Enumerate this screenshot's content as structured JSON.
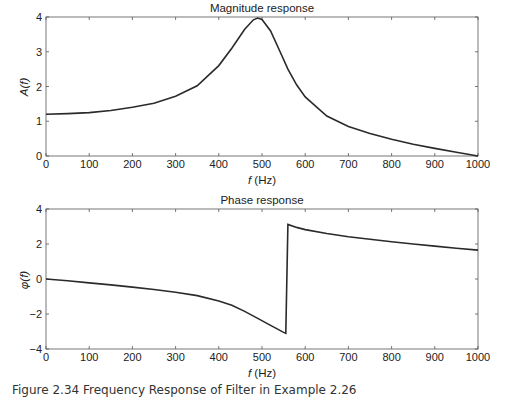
{
  "figure": {
    "caption": "Figure 2.34 Frequency Response of Filter in Example 2.26"
  },
  "chart_data": [
    {
      "type": "line",
      "title": "Magnitude response",
      "xlabel": "f (Hz)",
      "ylabel": "A(f)",
      "xlim": [
        0,
        1000
      ],
      "ylim": [
        0,
        4
      ],
      "xticks": [
        0,
        100,
        200,
        300,
        400,
        500,
        600,
        700,
        800,
        900,
        1000
      ],
      "yticks": [
        0,
        1,
        2,
        3,
        4
      ],
      "grid": false,
      "series": [
        {
          "name": "A(f)",
          "x": [
            0,
            50,
            100,
            150,
            200,
            250,
            300,
            350,
            400,
            430,
            460,
            480,
            490,
            500,
            520,
            540,
            560,
            580,
            600,
            650,
            700,
            750,
            800,
            850,
            900,
            950,
            1000
          ],
          "y": [
            1.2,
            1.22,
            1.25,
            1.31,
            1.4,
            1.52,
            1.72,
            2.02,
            2.6,
            3.1,
            3.65,
            3.92,
            3.97,
            3.93,
            3.6,
            3.05,
            2.5,
            2.05,
            1.7,
            1.15,
            0.85,
            0.65,
            0.48,
            0.34,
            0.22,
            0.11,
            0.0
          ]
        }
      ]
    },
    {
      "type": "line",
      "title": "Phase response",
      "xlabel": "f (Hz)",
      "ylabel": "φ(f)",
      "xlim": [
        0,
        1000
      ],
      "ylim": [
        -4,
        4
      ],
      "xticks": [
        0,
        100,
        200,
        300,
        400,
        500,
        600,
        700,
        800,
        900,
        1000
      ],
      "yticks": [
        -4,
        -2,
        0,
        2,
        4
      ],
      "grid": false,
      "series": [
        {
          "name": "φ(f)",
          "x": [
            0,
            50,
            100,
            150,
            200,
            250,
            300,
            350,
            400,
            430,
            460,
            490,
            520,
            550,
            555,
            560,
            580,
            600,
            650,
            700,
            750,
            800,
            850,
            900,
            950,
            1000
          ],
          "y": [
            0.0,
            -0.1,
            -0.22,
            -0.34,
            -0.46,
            -0.6,
            -0.76,
            -0.95,
            -1.25,
            -1.5,
            -1.85,
            -2.25,
            -2.65,
            -3.05,
            -3.1,
            3.12,
            2.95,
            2.82,
            2.6,
            2.42,
            2.27,
            2.13,
            2.0,
            1.88,
            1.76,
            1.65
          ]
        }
      ]
    }
  ]
}
